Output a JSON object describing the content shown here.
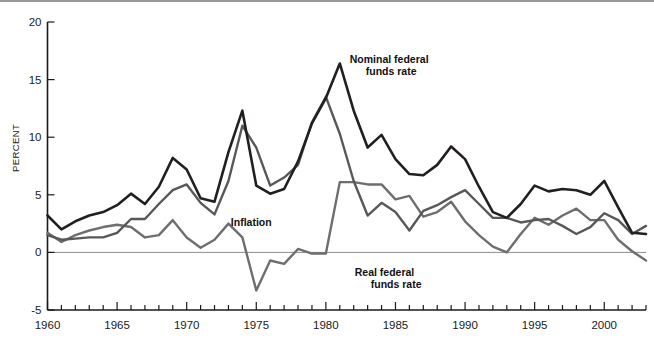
{
  "chart_data": {
    "type": "line",
    "title": "",
    "xlabel": "",
    "ylabel": "PERCENT",
    "xlim": [
      1960,
      2003
    ],
    "ylim": [
      -5,
      20
    ],
    "yticks": [
      -5,
      0,
      5,
      10,
      15,
      20
    ],
    "ytick_labels": [
      "-5",
      "0",
      "5",
      "10",
      "15",
      "20"
    ],
    "xticks": [
      1960,
      1965,
      1970,
      1975,
      1980,
      1985,
      1990,
      1995,
      2000
    ],
    "xtick_labels": [
      "1960",
      "1965",
      "1970",
      "1975",
      "1980",
      "1985",
      "1990",
      "1995",
      "2000"
    ],
    "minor_xtick_step": 1,
    "grid": false,
    "zero_line": true,
    "legend_position": "inline-annotations",
    "x": [
      1960,
      1961,
      1962,
      1963,
      1964,
      1965,
      1966,
      1967,
      1968,
      1969,
      1970,
      1971,
      1972,
      1973,
      1974,
      1975,
      1976,
      1977,
      1978,
      1979,
      1980,
      1981,
      1982,
      1983,
      1984,
      1985,
      1986,
      1987,
      1988,
      1989,
      1990,
      1991,
      1992,
      1993,
      1994,
      1995,
      1996,
      1997,
      1998,
      1999,
      2000,
      2001,
      2002,
      2003
    ],
    "series": [
      {
        "name": "Nominal federal funds rate",
        "color": "#231f20",
        "width": 2.6,
        "values": [
          3.2,
          2.0,
          2.7,
          3.2,
          3.5,
          4.1,
          5.1,
          4.2,
          5.7,
          8.2,
          7.2,
          4.7,
          4.4,
          8.7,
          12.3,
          5.8,
          5.1,
          5.5,
          7.9,
          11.2,
          13.4,
          16.4,
          12.3,
          9.1,
          10.2,
          8.1,
          6.8,
          6.7,
          7.6,
          9.2,
          8.1,
          5.7,
          3.5,
          3.0,
          4.2,
          5.8,
          5.3,
          5.5,
          5.4,
          5.0,
          6.2,
          3.9,
          1.7,
          1.6
        ],
        "label_text": "Nominal federal\nfunds rate",
        "label_x": 1981.0,
        "label_y": 16.6
      },
      {
        "name": "Inflation",
        "color": "#585858",
        "width": 2.4,
        "values": [
          1.5,
          1.1,
          1.2,
          1.3,
          1.3,
          1.7,
          2.9,
          2.9,
          4.2,
          5.4,
          5.9,
          4.3,
          3.3,
          6.2,
          11.0,
          9.1,
          5.8,
          6.5,
          7.6,
          11.3,
          13.5,
          10.3,
          6.2,
          3.2,
          4.3,
          3.5,
          1.9,
          3.6,
          4.1,
          4.8,
          5.4,
          4.2,
          3.0,
          3.0,
          2.6,
          2.8,
          2.9,
          2.3,
          1.6,
          2.2,
          3.4,
          2.8,
          1.6,
          2.3
        ],
        "label_text": "Inflation",
        "label_x": 1972.6,
        "label_y": 2.6
      },
      {
        "name": "Real federal funds rate",
        "color": "#6e6e6e",
        "width": 2.4,
        "values": [
          1.7,
          0.9,
          1.5,
          1.9,
          2.2,
          2.4,
          2.2,
          1.3,
          1.5,
          2.8,
          1.3,
          0.4,
          1.1,
          2.5,
          1.3,
          -3.3,
          -0.7,
          -1.0,
          0.3,
          -0.1,
          -0.1,
          6.1,
          6.1,
          5.9,
          5.9,
          4.6,
          4.9,
          3.1,
          3.5,
          4.4,
          2.7,
          1.5,
          0.5,
          0.0,
          1.6,
          3.0,
          2.4,
          3.2,
          3.8,
          2.8,
          2.8,
          1.1,
          0.1,
          -0.7
        ],
        "label_text": "Real federal\nfunds rate",
        "label_x": 1981.5,
        "label_y": -1.9
      }
    ]
  },
  "axis": {
    "y_title": "PERCENT"
  }
}
